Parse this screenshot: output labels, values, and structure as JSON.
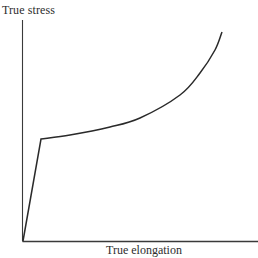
{
  "chart_data": {
    "type": "line",
    "title": "",
    "xlabel": "True elongation",
    "ylabel": "True stress",
    "grid": false,
    "legend": null,
    "ticks": {
      "x": [],
      "y": []
    },
    "series": [
      {
        "name": "true stress-strain curve",
        "description": "Steep linear elastic rise from origin to yield knee, then gradually accelerating strain-hardening curve",
        "points_px": [
          [
            23,
            241
          ],
          [
            41,
            139
          ],
          [
            70,
            135
          ],
          [
            110,
            127
          ],
          [
            140,
            118
          ],
          [
            180,
            95
          ],
          [
            200,
            73
          ],
          [
            215,
            50
          ],
          [
            222,
            32
          ]
        ],
        "x_normalized": [
          0.0,
          0.08,
          0.2,
          0.37,
          0.5,
          0.67,
          0.76,
          0.82,
          0.85
        ],
        "y_normalized": [
          0.0,
          0.46,
          0.48,
          0.52,
          0.56,
          0.66,
          0.76,
          0.86,
          0.94
        ]
      }
    ],
    "axes": {
      "origin_px": [
        23,
        241
      ],
      "x_axis_end_px": [
        258,
        241
      ],
      "y_axis_end_px": [
        22,
        20
      ]
    },
    "colors": {
      "line": "#2a2a2a",
      "axis": "#3a3a3a",
      "background": "#ffffff"
    }
  }
}
